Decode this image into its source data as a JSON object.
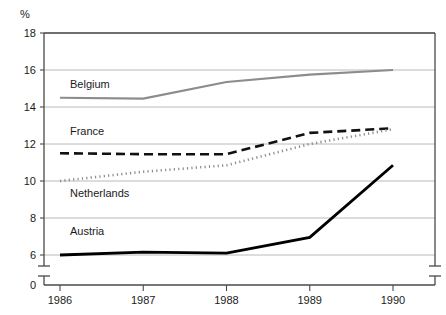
{
  "chart_data": {
    "type": "line",
    "title": "",
    "xlabel": "",
    "ylabel": "%",
    "categories": [
      "1986",
      "1987",
      "1988",
      "1989",
      "1990"
    ],
    "x": [
      1986,
      1987,
      1988,
      1989,
      1990
    ],
    "ylim": [
      6,
      18
    ],
    "y_ticks": [
      "18",
      "16",
      "14",
      "12",
      "10",
      "8",
      "6",
      "0"
    ],
    "y_tick_values": [
      18,
      16,
      14,
      12,
      10,
      8,
      6,
      0
    ],
    "axis_break": true,
    "grid": "horizontal",
    "legend": "inline-labels",
    "series": [
      {
        "name": "Belgium",
        "values": [
          14.5,
          14.45,
          15.35,
          15.75,
          16.0
        ],
        "style": "solid",
        "color": "#8c8c8c",
        "width": 2.2,
        "label_x": 1986.12,
        "label_y": 15.05
      },
      {
        "name": "France",
        "values": [
          11.5,
          11.45,
          11.45,
          12.6,
          12.85
        ],
        "style": "dashed",
        "color": "#111111",
        "width": 2.6,
        "label_x": 1986.12,
        "label_y": 12.5
      },
      {
        "name": "Netherlands",
        "values": [
          10.0,
          10.5,
          10.85,
          12.0,
          12.8
        ],
        "style": "dotted",
        "color": "#8c8c8c",
        "width": 2.6,
        "label_x": 1986.12,
        "label_y": 9.15
      },
      {
        "name": "Austria",
        "values": [
          6.0,
          6.15,
          6.1,
          6.95,
          10.85
        ],
        "style": "solid",
        "color": "#000000",
        "width": 2.8,
        "label_x": 1986.12,
        "label_y": 7.1
      }
    ]
  },
  "axis": {
    "unit_label": "%",
    "zero_label": "0"
  }
}
